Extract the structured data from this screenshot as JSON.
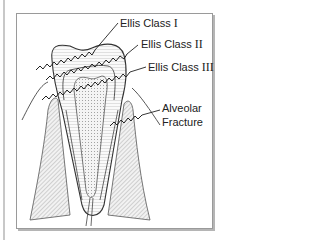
{
  "figure": {
    "labels": {
      "ellis_class_1": {
        "prefix": "Ellis Class",
        "numeral": "I"
      },
      "ellis_class_2": {
        "prefix": "Ellis Class",
        "numeral": "II"
      },
      "ellis_class_3": {
        "prefix": "Ellis Class",
        "numeral": "III"
      },
      "alveolar_line1": "Alveolar",
      "alveolar_line2": "Fracture"
    },
    "colors": {
      "line": "#333333",
      "frame_border": "#9a9a9a",
      "bone_hatch": "#8a8a8a",
      "pulp_fill": "#e8e8e8"
    }
  }
}
